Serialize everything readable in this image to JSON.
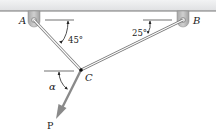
{
  "diagram": {
    "points": {
      "A": {
        "label": "A"
      },
      "B": {
        "label": "B"
      },
      "C": {
        "label": "C"
      }
    },
    "angles": {
      "angle_A": "45°",
      "angle_B": "25°",
      "angle_C": "α"
    },
    "force": {
      "label": "P"
    },
    "colors": {
      "ceiling": "#e6e7e9",
      "member": "#9a9a9a",
      "force_arrow": "#8a8a8a",
      "support": "#bdbdbd"
    }
  }
}
